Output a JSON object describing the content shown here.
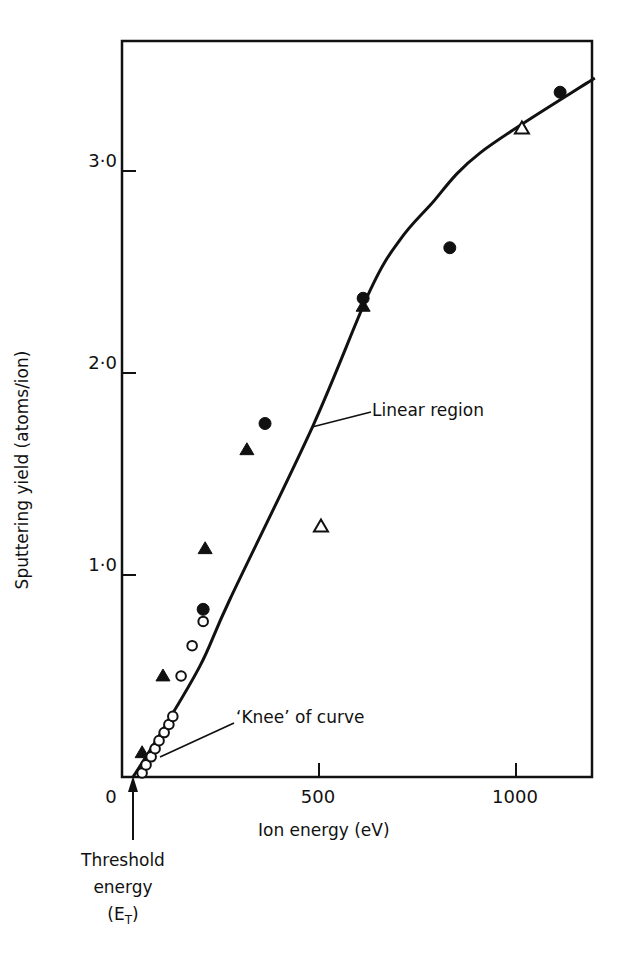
{
  "chart_data": {
    "type": "scatter",
    "title": "",
    "xlabel": "Ion energy (eV)",
    "ylabel": "Sputtering yield (atoms/ion)",
    "xlim": [
      0,
      1200
    ],
    "ylim": [
      0,
      3.5
    ],
    "x_ticks": [
      "0",
      "500",
      "1000"
    ],
    "y_ticks": [
      "1·0",
      "2·0",
      "3·0"
    ],
    "grid": false,
    "legend": "none",
    "series": [
      {
        "name": "filled circles",
        "marker": "filled-circle",
        "points": [
          [
            206,
            0.83
          ],
          [
            363,
            1.75
          ],
          [
            612,
            2.37
          ],
          [
            832,
            2.62
          ],
          [
            1112,
            3.39
          ]
        ]
      },
      {
        "name": "filled triangles",
        "marker": "filled-triangle",
        "points": [
          [
            51,
            0.12
          ],
          [
            104,
            0.5
          ],
          [
            211,
            1.13
          ],
          [
            317,
            1.62
          ],
          [
            612,
            2.33
          ]
        ]
      },
      {
        "name": "open triangles",
        "marker": "open-triangle",
        "points": [
          [
            505,
            1.24
          ],
          [
            1015,
            3.21
          ]
        ]
      },
      {
        "name": "open circles",
        "marker": "open-circle",
        "points": [
          [
            51,
            0.02
          ],
          [
            61,
            0.06
          ],
          [
            74,
            0.1
          ],
          [
            84,
            0.14
          ],
          [
            94,
            0.18
          ],
          [
            107,
            0.22
          ],
          [
            119,
            0.26
          ],
          [
            129,
            0.3
          ],
          [
            150,
            0.5
          ],
          [
            178,
            0.65
          ],
          [
            206,
            0.77
          ]
        ]
      },
      {
        "name": "fitted curve",
        "marker": "line",
        "points": [
          [
            28,
            0
          ],
          [
            96,
            0.21
          ],
          [
            198,
            0.55
          ],
          [
            274,
            0.88
          ],
          [
            485,
            1.74
          ],
          [
            630,
            2.41
          ],
          [
            706,
            2.66
          ],
          [
            782,
            2.83
          ],
          [
            909,
            3.09
          ],
          [
            1200,
            3.46
          ]
        ]
      }
    ],
    "annotations": [
      {
        "text": "Linear region",
        "target": [
          485,
          1.74
        ]
      },
      {
        "text": "'Knee' of curve",
        "target": [
          96,
          0.21
        ]
      },
      {
        "text": "Threshold energy (ET)",
        "target": [
          28,
          0
        ]
      }
    ]
  },
  "labels": {
    "xlabel": "Ion energy (eV)",
    "ylabel": "Sputtering yield  (atoms/ion)",
    "linear_region": "Linear region",
    "knee": "‘Knee’  of  curve",
    "threshold_line1": "Threshold",
    "threshold_line2": "energy",
    "threshold_E": "(E",
    "threshold_T": "T",
    "threshold_close": ")",
    "x_ticks": [
      "0",
      "500",
      "1000"
    ],
    "y_ticks": [
      "1·0",
      "2·0",
      "3·0"
    ]
  }
}
